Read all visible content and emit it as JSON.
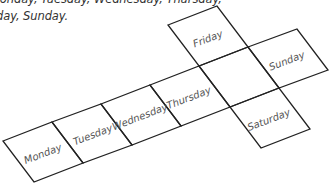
{
  "caption": {
    "line1": "Monday, Tuesday, Wednesday, Thursday,",
    "line2": "day, Sunday."
  },
  "net": {
    "cells": [
      {
        "label": "Monday"
      },
      {
        "label": "Tuesday"
      },
      {
        "label": "Wednesday"
      },
      {
        "label": "Thursday"
      },
      {
        "label": ""
      },
      {
        "label": "Friday"
      },
      {
        "label": "Sunday"
      },
      {
        "label": "Saturday"
      }
    ],
    "line_color": "#222222",
    "label_color": "#555555"
  }
}
